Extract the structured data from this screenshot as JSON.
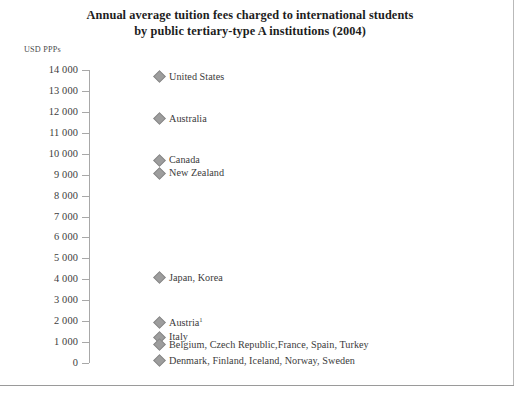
{
  "title": {
    "line1": "Annual average tuition fees charged to international students",
    "line2": "by public tertiary-type A institutions (2004)"
  },
  "axis_unit": "USD PPPs",
  "chart_data": {
    "type": "scatter",
    "title": "Annual average tuition fees charged to international students by public tertiary-type A institutions (2004)",
    "xlabel": "",
    "ylabel": "USD PPPs",
    "ylim": [
      0,
      14000
    ],
    "grid": false,
    "legend": "none",
    "y_ticks": [
      14000,
      13000,
      12000,
      11000,
      10000,
      9000,
      8000,
      7000,
      6000,
      5000,
      4000,
      3000,
      2000,
      1000,
      0
    ],
    "y_tick_labels": [
      "14 000",
      "13 000",
      "12 000",
      "11 000",
      "10 000",
      "9 000",
      "8 000",
      "7 000",
      "6 000",
      "5 000",
      "4 000",
      "3 000",
      "2 000",
      "1 000",
      "0"
    ],
    "marker": "diamond",
    "marker_color": "#9d9d9d",
    "points": [
      {
        "label": "United States",
        "value": 13700,
        "footnote": ""
      },
      {
        "label": "Australia",
        "value": 11700,
        "footnote": ""
      },
      {
        "label": "Canada",
        "value": 9700,
        "footnote": ""
      },
      {
        "label": "New Zealand",
        "value": 9100,
        "footnote": ""
      },
      {
        "label": "Japan, Korea",
        "value": 4100,
        "footnote": ""
      },
      {
        "label": "Austria",
        "value": 1950,
        "footnote": "1"
      },
      {
        "label": "Italy",
        "value": 1250,
        "footnote": ""
      },
      {
        "label": "Belgium, Czech Republic,France, Spain, Turkey",
        "value": 900,
        "footnote": ""
      },
      {
        "label": "Denmark, Finland, Iceland, Norway, Sweden",
        "value": 130,
        "footnote": ""
      }
    ]
  }
}
